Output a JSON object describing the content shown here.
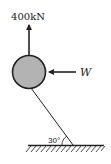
{
  "diagram": {
    "type": "free-body diagram",
    "force_up": {
      "label": "400kN",
      "direction": "up"
    },
    "force_horizontal": {
      "label": "W",
      "direction": "left"
    },
    "body": {
      "shape": "circle",
      "fill": "#b3b3b3",
      "stroke": "#222222"
    },
    "rope": {
      "angle_label": "30°",
      "angle_with": "ground"
    },
    "ground": {
      "hatched": true
    }
  },
  "colors": {
    "line": "#222222",
    "ball_fill": "#b3b3b3",
    "background": "#ffffff"
  }
}
